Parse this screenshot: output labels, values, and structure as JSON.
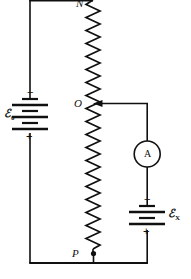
{
  "figure": {
    "kind": "potentiometer-circuit-diagram",
    "background_color": "#ffffff",
    "line_color": "#101010"
  },
  "labels": {
    "node_n": "N",
    "node_o": "O",
    "node_p": "P",
    "emf_driver_symbol": "ℰ",
    "emf_driver_subscript": "0",
    "emf_unknown_symbol": "ℰ",
    "emf_unknown_subscript": "X",
    "ammeter_letter": "A"
  },
  "polarity": {
    "driver_negative": "−",
    "driver_positive": "+",
    "unknown_negative": "−",
    "unknown_positive": "+"
  },
  "components": {
    "driver_battery": {
      "name": "driver-battery",
      "cells": 3,
      "orientation": "vertical"
    },
    "unknown_battery": {
      "name": "unknown-emf-battery",
      "cells": 2,
      "orientation": "vertical"
    },
    "slide_wire_resistor": {
      "name": "slide-wire-resistor",
      "orientation": "vertical",
      "zigzag_peaks": 24
    },
    "ammeter": {
      "name": "ammeter",
      "shape": "circle"
    },
    "slider_contact": {
      "name": "slider-contact-arrow",
      "direction": "left"
    },
    "tap_point": {
      "name": "tap-point-p",
      "shape": "filled-dot"
    }
  }
}
